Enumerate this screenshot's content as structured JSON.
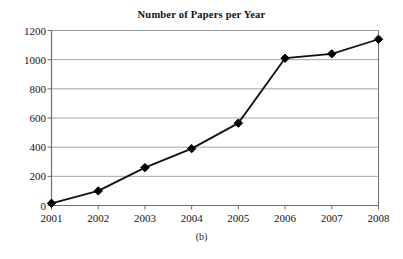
{
  "figure": {
    "caption": "(b)",
    "background_color": "#ffffff"
  },
  "chart_data": {
    "type": "line",
    "title": "Number of Papers per Year",
    "xlabel": "",
    "ylabel": "",
    "categories": [
      "2001",
      "2002",
      "2003",
      "2004",
      "2005",
      "2006",
      "2007",
      "2008"
    ],
    "x": [
      2001,
      2002,
      2003,
      2004,
      2005,
      2006,
      2007,
      2008
    ],
    "values": [
      15,
      100,
      260,
      390,
      565,
      1010,
      1040,
      1140
    ],
    "series": [
      {
        "name": "Number of Papers",
        "values": [
          15,
          100,
          260,
          390,
          565,
          1010,
          1040,
          1140
        ]
      }
    ],
    "ylim": [
      0,
      1200
    ],
    "yticks": [
      0,
      200,
      400,
      600,
      800,
      1000,
      1200
    ],
    "ytick_labels": [
      "0",
      "200",
      "400",
      "600",
      "800",
      "1000",
      "1200"
    ],
    "xtick_labels": [
      "2001",
      "2002",
      "2003",
      "2004",
      "2005",
      "2006",
      "2007",
      "2008"
    ],
    "grid": "horizontal",
    "legend": "none",
    "marker": "diamond",
    "line_color": "#111111",
    "marker_color": "#000000",
    "grid_color": "#9a9a9a",
    "axis_color": "#6e6e6e"
  }
}
